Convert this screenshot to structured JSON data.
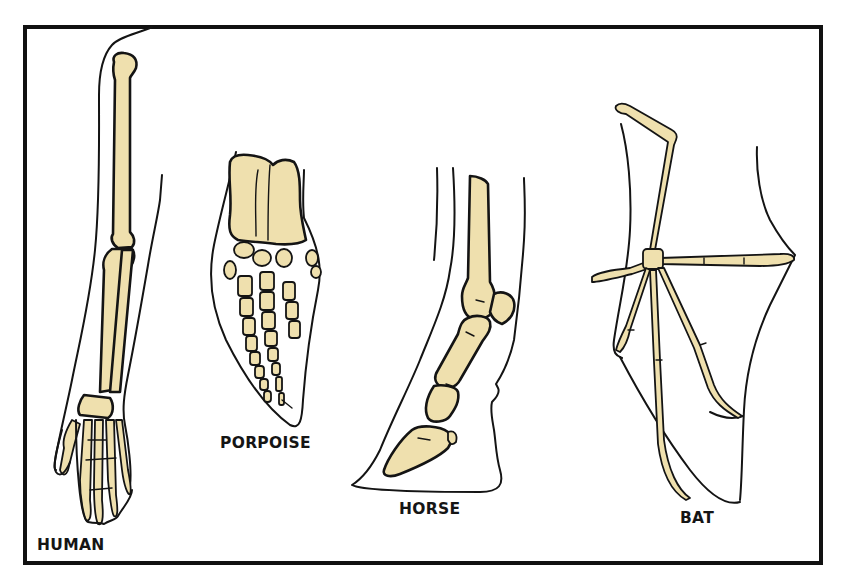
{
  "figure": {
    "colors": {
      "bone": "#efe0ae",
      "outline": "#141414",
      "background": "#ffffff"
    },
    "panels": [
      {
        "id": "human",
        "label": "HUMAN"
      },
      {
        "id": "porpoise",
        "label": "PORPOISE"
      },
      {
        "id": "horse",
        "label": "HORSE"
      },
      {
        "id": "bat",
        "label": "BAT"
      }
    ]
  }
}
